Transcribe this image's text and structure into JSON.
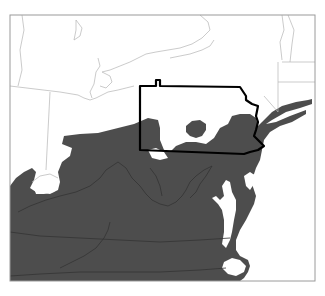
{
  "map": {
    "region": "Northeastern / Mid-Atlantic United States",
    "highlighted_state": "Pennsylvania",
    "colors": {
      "background": "#ffffff",
      "shaded_area": "#4d4d4d",
      "thin_borders": "#b4b4b4",
      "inner_borders_on_shade": "#333333",
      "highlight_outline": "#000000",
      "frame": "#9a9a9a"
    },
    "frame": {
      "x": 10,
      "y": 15,
      "width": 305,
      "height": 266
    },
    "layers": {
      "shaded_area_main": "M10,186 L16,178 L24,172 L32,168 L36,172 L34,180 L30,188 L36,192 L50,194 L58,190 L60,182 L58,172 L62,162 L70,156 L72,148 L62,144 L64,136 L80,134 L98,133 L118,128 L134,124 L148,118 L158,120 L160,128 L160,140 L164,150 L170,152 L176,146 L186,142 L196,142 L206,144 L214,138 L220,128 L228,124 L232,116 L240,114 L250,114 L256,118 L258,126 L262,122 L272,112 L282,106 L296,102 L308,100 L312,99 L312,104 L300,108 L286,112 L272,120 L266,124 L276,122 L290,116 L306,110 L306,114 L292,122 L280,126 L270,132 L264,140 L262,150 L260,160 L256,168 L254,174 L250,178 L252,184 L256,196 L254,204 L250,212 L246,220 L240,230 L236,240 L236,250 L240,256 L248,260 L250,266 L248,272 L244,278 L240,281 L10,281 Z",
      "shaded_area_island": "M186,126 L192,121 L200,120 L206,124 L206,130 L202,136 L196,138 L190,136 L186,132 Z",
      "water_ohio_gap": "M148,150 L156,148 L164,152 L168,158 L160,160 L152,158 Z",
      "water_lake_michigan_south": "M34,188 L38,182 L40,174 L46,170 L54,170 L58,176 L58,186 L54,192 L44,194 L36,194 Z",
      "water_chesapeake": "M222,186 L226,180 L230,182 L232,192 L236,200 L236,210 L234,220 L232,232 L230,240 L226,248 L222,244 L224,232 L224,220 L222,210 L218,204 L212,198 L216,196 L220,200 L224,196 Z",
      "water_delaware_bay": "M244,176 L250,172 L256,176 L254,184 L250,190 L246,186 Z",
      "water_pamlico": "M224,262 L232,258 L240,260 L246,266 L244,272 L236,276 L228,274 L222,268 Z",
      "water_east_of_coast": "M262,150 L268,138 L280,130 L296,124 L315,120 L315,281 L244,281 L250,272 L252,262 L246,256 L240,250 L240,238 L246,226 L252,214 L258,202 L262,192 L264,178 L262,166 Z",
      "state_borders_thin": [
        "M22,15 L24,30 L20,50 L22,70 L18,86",
        "M10,86 L60,92 L78,95",
        "M50,92 L46,170",
        "M78,95 L84,98 L90,100 L96,98 L100,96",
        "M100,96 L108,92 L118,90 L126,88 L134,86",
        "M32,182 L40,176 L50,174 L58,178",
        "M200,15 L208,22 L210,30 L202,38 L192,44 L180,48 L168,50 L156,52 L146,54 L138,58 L130,62 L120,66 L110,70 L102,72",
        "M76,20 L82,28 L80,36 L74,40 L76,30 Z",
        "M98,58 L100,66 L96,72 L94,84 L90,92 L92,98",
        "M102,72 L110,76 L112,82 L106,88 L100,86",
        "M170,58 L190,54 L202,50 L210,46 L214,40",
        "M282,15 L284,30 L280,42 L282,60",
        "M288,15 L294,30 L292,44 L290,62",
        "M282,62 L315,62",
        "M278,82 L315,82",
        "M278,62 L278,112",
        "M264,96 L278,112"
      ],
      "state_borders_dark_on_shade": [
        "M18,212 L30,206 L46,200 L60,196 L76,192 L90,186 L100,178 L106,170 L112,166 L118,162",
        "M118,162 L126,168 L132,178 L140,186 L146,194 L152,200 L160,204 L168,206 L176,202 L182,196 L186,190 L190,182 L196,176 L204,170 L212,166",
        "M212,166 L206,176 L200,184 L196,192 L190,198",
        "M10,232 L40,236 L80,238 L120,240 L160,242 L200,240 L230,238",
        "M60,268 L72,262 L84,256 L96,248 L104,238 L108,230 L110,222",
        "M10,276 L40,274 L80,272 L120,272 L160,272 L200,270 L226,268",
        "M150,168 L156,176 L160,186 L162,196"
      ],
      "pennsylvania_outline": "M140,86 L156,86 L156,80 L160,80 L160,86 L240,87 L246,96 L246,100 L252,104 L258,106 L256,116 L258,122 L256,130 L254,136 L260,142 L264,146 L258,150 L250,152 L244,154 L140,150 Z"
    }
  }
}
